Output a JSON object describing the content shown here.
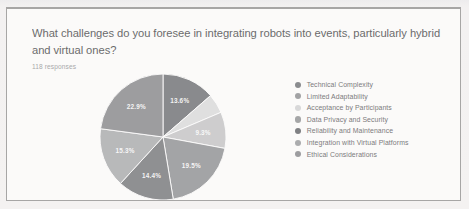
{
  "card": {
    "question": "What challenges do you foresee in integrating robots into events, particularly hybrid and virtual ones?",
    "response_count": "118 responses"
  },
  "chart_data": {
    "type": "pie",
    "title": "What challenges do you foresee in integrating robots into events, particularly hybrid and virtual ones?",
    "subtitle": "118 responses",
    "legend_position": "right",
    "categories": [
      "Technical Complexity",
      "Limited Adaptability",
      "Acceptance by Participants",
      "Data Privacy and Security",
      "Reliability and Maintenance",
      "Integration with Virtual Platforms",
      "Ethical Considerations"
    ],
    "values": [
      13.6,
      5.0,
      9.3,
      19.5,
      14.4,
      15.3,
      22.9
    ],
    "value_labels": [
      "13.6%",
      "",
      "9.3%",
      "19.5%",
      "14.4%",
      "15.3%",
      "22.9%"
    ],
    "colors": [
      "#6e7174",
      "#d9dadb",
      "#c3c5c6",
      "#8f9193",
      "#75777a",
      "#a9abad",
      "#86888b"
    ],
    "unit": "%"
  },
  "legend": {
    "items": [
      {
        "label": "Technical Complexity",
        "color": "#6e7174"
      },
      {
        "label": "Limited Adaptability",
        "color": "#8b8d8f"
      },
      {
        "label": "Acceptance by Participants",
        "color": "#cfd0d1"
      },
      {
        "label": "Data Privacy and Security",
        "color": "#8f9193"
      },
      {
        "label": "Reliability and Maintenance",
        "color": "#5f6265"
      },
      {
        "label": "Integration with Virtual Platforms",
        "color": "#97999b"
      },
      {
        "label": "Ethical Considerations",
        "color": "#85878a"
      }
    ]
  }
}
